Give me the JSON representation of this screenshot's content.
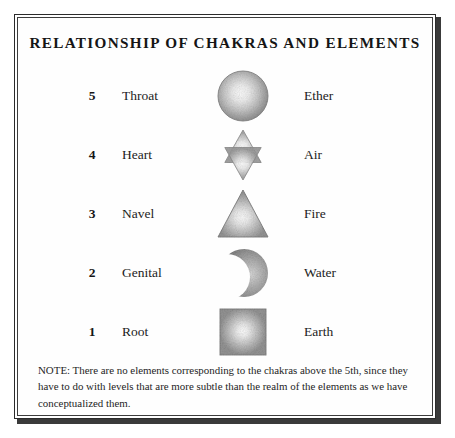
{
  "plate": {
    "title": "RELATIONSHIP OF CHAKRAS AND ELEMENTS",
    "note": "NOTE: There are no elements corresponding to the chakras above the 5th, since they have to do with levels that are more subtle than the realm of the elements as we have conceptualized them.",
    "rows": [
      {
        "number": "5",
        "chakra": "Throat",
        "symbol": "circle-sphere-icon",
        "element": "Ether"
      },
      {
        "number": "4",
        "chakra": "Heart",
        "symbol": "hexagram-star-icon",
        "element": "Air"
      },
      {
        "number": "3",
        "chakra": "Navel",
        "symbol": "upward-triangle-icon",
        "element": "Fire"
      },
      {
        "number": "2",
        "chakra": "Genital",
        "symbol": "crescent-moon-icon",
        "element": "Water"
      },
      {
        "number": "1",
        "chakra": "Root",
        "symbol": "square-icon",
        "element": "Earth"
      }
    ],
    "colors": {
      "background": "#ffffff",
      "border": "#2b2b2b",
      "text": "#1a1a1a",
      "symbol_fill_edge": "#8a8a8a",
      "symbol_fill_center": "#f2f2f2"
    }
  }
}
